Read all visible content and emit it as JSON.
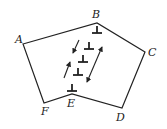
{
  "diagram": {
    "vertices": [
      {
        "id": "A",
        "label": "A",
        "x": 23,
        "y": 44,
        "lx": 15,
        "ly": 43
      },
      {
        "id": "B",
        "label": "B",
        "x": 97,
        "y": 23,
        "lx": 92,
        "ly": 18
      },
      {
        "id": "C",
        "label": "C",
        "x": 145,
        "y": 52,
        "lx": 148,
        "ly": 56
      },
      {
        "id": "D",
        "label": "D",
        "x": 122,
        "y": 108,
        "lx": 116,
        "ly": 121
      },
      {
        "id": "E",
        "label": "E",
        "x": 72,
        "y": 94,
        "lx": 67,
        "ly": 107
      },
      {
        "id": "F",
        "label": "F",
        "x": 44,
        "y": 103,
        "lx": 41,
        "ly": 115
      }
    ],
    "polygon_order": [
      "A",
      "B",
      "C",
      "D",
      "E",
      "F"
    ],
    "dislocations": [
      {
        "symbol": "⊥",
        "x": 97,
        "y": 33
      },
      {
        "symbol": "⊥",
        "x": 89,
        "y": 49
      },
      {
        "symbol": "⊥",
        "x": 83,
        "y": 62
      },
      {
        "symbol": "⊥",
        "x": 78,
        "y": 75
      },
      {
        "symbol": "⊥",
        "x": 72,
        "y": 91
      }
    ],
    "arrows": [
      {
        "name": "arrow-down-left",
        "x1": 79,
        "y1": 40,
        "x2": 73,
        "y2": 53,
        "heads": "end"
      },
      {
        "name": "arrow-up-right",
        "x1": 64,
        "y1": 78,
        "x2": 70,
        "y2": 62,
        "heads": "end"
      },
      {
        "name": "arrow-double",
        "x1": 102,
        "y1": 47,
        "x2": 87,
        "y2": 82,
        "heads": "both"
      }
    ],
    "stroke_color": "#222222"
  }
}
